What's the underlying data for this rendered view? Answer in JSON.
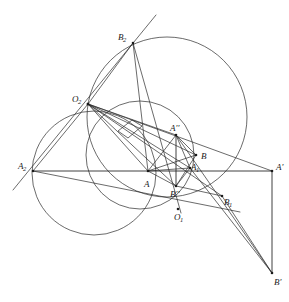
{
  "figure": {
    "width": 289,
    "height": 302,
    "background": "#ffffff",
    "stroke_color": "#2b2b2b",
    "stroke_width": 0.7,
    "label_color": "#1a1a1a"
  },
  "points": [
    {
      "id": "A2",
      "label": "A",
      "sub": "2",
      "prime": "",
      "x": 33,
      "y": 171,
      "lx": 18,
      "ly": 162,
      "dot": true
    },
    {
      "id": "O2",
      "label": "O",
      "sub": "2",
      "prime": "",
      "x": 88,
      "y": 104,
      "lx": 72,
      "ly": 95,
      "dot": true
    },
    {
      "id": "B2",
      "label": "B",
      "sub": "2",
      "prime": "",
      "x": 133,
      "y": 43,
      "lx": 118,
      "ly": 33,
      "dot": true
    },
    {
      "id": "A",
      "label": "A",
      "sub": "",
      "prime": "",
      "x": 148,
      "y": 171,
      "lx": 144,
      "ly": 180,
      "dot": true
    },
    {
      "id": "App",
      "label": "A",
      "sub": "",
      "prime": "''",
      "x": 176,
      "y": 135,
      "lx": 170,
      "ly": 124,
      "dot": true
    },
    {
      "id": "B",
      "label": "B",
      "sub": "",
      "prime": "",
      "x": 196,
      "y": 155,
      "lx": 201,
      "ly": 152,
      "dot": true
    },
    {
      "id": "A1",
      "label": "A",
      "sub": "1",
      "prime": "",
      "x": 190,
      "y": 168,
      "lx": 191,
      "ly": 163,
      "dot": true
    },
    {
      "id": "Bpp",
      "label": "B",
      "sub": "",
      "prime": "''",
      "x": 176,
      "y": 186,
      "lx": 170,
      "ly": 190,
      "dot": true
    },
    {
      "id": "O1",
      "label": "O",
      "sub": "1",
      "prime": "",
      "x": 178,
      "y": 209,
      "lx": 174,
      "ly": 213,
      "dot": true
    },
    {
      "id": "B1",
      "label": "B",
      "sub": "1",
      "prime": "",
      "x": 222,
      "y": 196,
      "lx": 224,
      "ly": 198,
      "dot": true
    },
    {
      "id": "Ap",
      "label": "A",
      "sub": "",
      "prime": "'",
      "x": 272,
      "y": 171,
      "lx": 276,
      "ly": 163,
      "dot": true
    },
    {
      "id": "Bp",
      "label": "B",
      "sub": "",
      "prime": "'",
      "x": 272,
      "y": 273,
      "lx": 274,
      "ly": 278,
      "dot": true
    }
  ],
  "circles": [
    {
      "id": "circle-left",
      "cx": 94,
      "cy": 173,
      "r": 62,
      "note": "circle through O2 and A2"
    },
    {
      "id": "circle-big",
      "cx": 167,
      "cy": 117,
      "r": 80,
      "note": "large circle through O2 and B2"
    },
    {
      "id": "circle-middle",
      "cx": 140,
      "cy": 155,
      "r": 54,
      "note": "mid circle through O2, A'' and O1"
    }
  ],
  "segments": [
    {
      "id": "baseline-A2-Ap",
      "from": "A2",
      "to": "Ap"
    },
    {
      "id": "line-A2-B2",
      "from": "x1",
      "to": "x2"
    },
    {
      "id": "O2-A2",
      "from": "O2",
      "to": "A2"
    },
    {
      "id": "O2-B2",
      "from": "O2",
      "to": "B2"
    },
    {
      "id": "O2-A",
      "from": "O2",
      "to": "A"
    },
    {
      "id": "O2-App",
      "from": "O2",
      "to": "App"
    },
    {
      "id": "O2-B",
      "from": "O2",
      "to": "B"
    },
    {
      "id": "O2-A1",
      "from": "O2",
      "to": "A1"
    },
    {
      "id": "O2-Bpp",
      "from": "O2",
      "to": "Bpp"
    },
    {
      "id": "O2-B1",
      "from": "O2",
      "to": "B1"
    },
    {
      "id": "O2-Ap",
      "from": "O2",
      "to": "Ap"
    },
    {
      "id": "B2-A",
      "from": "B2",
      "to": "A"
    },
    {
      "id": "B2-Bpp",
      "from": "B2",
      "to": "Bpp"
    },
    {
      "id": "A-App",
      "from": "A",
      "to": "App"
    },
    {
      "id": "A-B",
      "from": "A",
      "to": "B"
    },
    {
      "id": "A-A1",
      "from": "A",
      "to": "A1"
    },
    {
      "id": "A-Bpp",
      "from": "A",
      "to": "Bpp"
    },
    {
      "id": "App-Bpp",
      "from": "App",
      "to": "Bpp"
    },
    {
      "id": "App-B",
      "from": "App",
      "to": "B"
    },
    {
      "id": "App-A1",
      "from": "App",
      "to": "A1"
    },
    {
      "id": "App-Bp",
      "from": "App",
      "to": "Bp"
    },
    {
      "id": "Bpp-B",
      "from": "Bpp",
      "to": "B"
    },
    {
      "id": "Bpp-A1",
      "from": "Bpp",
      "to": "A1"
    },
    {
      "id": "Bpp-B1",
      "from": "Bpp",
      "to": "B1"
    },
    {
      "id": "A1-Bp",
      "from": "A1",
      "to": "Bp"
    },
    {
      "id": "B1-Bp",
      "from": "B1",
      "to": "Bp"
    },
    {
      "id": "Ap-Bp",
      "from": "Ap",
      "to": "Bp"
    },
    {
      "id": "A2-B1",
      "from": "A2",
      "to": "B1"
    }
  ],
  "marks": [
    {
      "id": "angle-tick-1",
      "note": "small quadrilateral tick mark between rays from O2",
      "x": 128,
      "y": 126
    }
  ]
}
